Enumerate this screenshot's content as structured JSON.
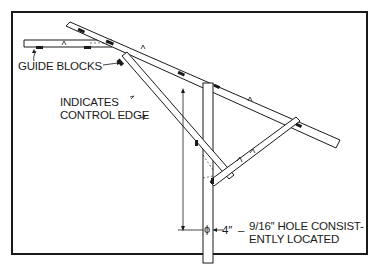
{
  "diagram": {
    "labels": {
      "guide_blocks": "GUIDE BLOCKS",
      "control_edge_line1": "INDICATES",
      "control_edge_line2": "CONTROL EDGE",
      "dimension": "4″",
      "hole_line1": "9/16″ HOLE CONSIST-",
      "hole_line2": "ENTLY LOCATED"
    },
    "symbols": {
      "hole_symbol": "ϕ",
      "control_edge_mark": "‸"
    },
    "colors": {
      "ink": "#1a1a1a",
      "background": "#ffffff"
    }
  }
}
